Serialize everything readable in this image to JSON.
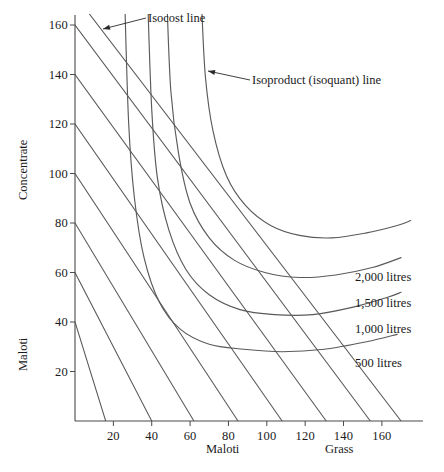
{
  "chart_data": {
    "type": "line",
    "title": "",
    "xlabel_left": "Maloti",
    "xlabel_right": "Grass",
    "ylabel_top": "Concentrate",
    "ylabel_bottom": "Maloti",
    "xlim": [
      0,
      170
    ],
    "ylim": [
      0,
      168
    ],
    "grid": false,
    "legend_position": "inline-right",
    "x_ticks": [
      20,
      40,
      60,
      80,
      100,
      120,
      140,
      160
    ],
    "y_ticks": [
      20,
      40,
      60,
      80,
      100,
      120,
      140,
      160
    ],
    "x_tick_labels": [
      "20",
      "40",
      "60",
      "80",
      "100",
      "120",
      "140",
      "160"
    ],
    "y_tick_labels": [
      "20",
      "40",
      "60",
      "80",
      "100",
      "120",
      "140",
      "160"
    ],
    "annotations": [
      {
        "name": "isocost-annotation",
        "text": "Isocost line",
        "label_x": 148,
        "label_y": 11,
        "arrow_from_x": 146,
        "arrow_from_y": 18,
        "arrow_to_x": 103,
        "arrow_to_y": 29
      },
      {
        "name": "isoquant-annotation",
        "text": "Isoproduct (isoquant) line",
        "label_x": 252,
        "label_y": 73,
        "arrow_from_x": 250,
        "arrow_from_y": 80,
        "arrow_to_x": 208,
        "arrow_to_y": 71
      }
    ],
    "series": [
      {
        "name": "isocost-1",
        "kind": "isocost",
        "points": [
          [
            0,
            40
          ],
          [
            16,
            0
          ]
        ]
      },
      {
        "name": "isocost-2",
        "kind": "isocost",
        "points": [
          [
            0,
            60
          ],
          [
            40,
            0
          ]
        ]
      },
      {
        "name": "isocost-3",
        "kind": "isocost",
        "points": [
          [
            0,
            80
          ],
          [
            62,
            0
          ]
        ]
      },
      {
        "name": "isocost-4",
        "kind": "isocost",
        "points": [
          [
            0,
            100
          ],
          [
            85,
            0
          ]
        ]
      },
      {
        "name": "isocost-5",
        "kind": "isocost",
        "points": [
          [
            0,
            120
          ],
          [
            108,
            0
          ]
        ]
      },
      {
        "name": "isocost-6",
        "kind": "isocost",
        "points": [
          [
            0,
            140
          ],
          [
            131,
            0
          ]
        ]
      },
      {
        "name": "isocost-7",
        "kind": "isocost",
        "points": [
          [
            0,
            160
          ],
          [
            154,
            0
          ]
        ]
      },
      {
        "name": "isocost-8",
        "kind": "isocost",
        "points": [
          [
            4,
            168
          ],
          [
            170,
            0
          ]
        ]
      },
      {
        "name": "500 litres",
        "kind": "isoquant",
        "value": 500,
        "label": "500 litres",
        "label_x": 355,
        "label_y": 363,
        "points": [
          [
            26,
            168
          ],
          [
            28,
            120
          ],
          [
            31,
            90
          ],
          [
            36,
            66
          ],
          [
            44,
            48
          ],
          [
            55,
            37
          ],
          [
            70,
            31
          ],
          [
            88,
            29
          ],
          [
            108,
            28
          ],
          [
            130,
            29
          ],
          [
            152,
            32
          ],
          [
            168,
            35
          ]
        ]
      },
      {
        "name": "1,000 litres",
        "kind": "isoquant",
        "value": 1000,
        "label": "1,000 litres",
        "label_x": 355,
        "label_y": 329,
        "points": [
          [
            38,
            168
          ],
          [
            40,
            126
          ],
          [
            43,
            98
          ],
          [
            49,
            77
          ],
          [
            58,
            61
          ],
          [
            70,
            51
          ],
          [
            86,
            45
          ],
          [
            104,
            43
          ],
          [
            124,
            43
          ],
          [
            145,
            46
          ],
          [
            163,
            50
          ],
          [
            170,
            52
          ]
        ]
      },
      {
        "name": "1,500 litres",
        "kind": "isoquant",
        "value": 1500,
        "label": "1,500 litres",
        "label_x": 355,
        "label_y": 303,
        "points": [
          [
            48,
            168
          ],
          [
            50,
            133
          ],
          [
            54,
            108
          ],
          [
            60,
            88
          ],
          [
            70,
            74
          ],
          [
            83,
            65
          ],
          [
            99,
            60
          ],
          [
            117,
            58
          ],
          [
            136,
            59
          ],
          [
            155,
            62
          ],
          [
            170,
            66
          ]
        ]
      },
      {
        "name": "2,000 litres",
        "kind": "isoquant",
        "value": 2000,
        "label": "2,000 litres",
        "label_x": 355,
        "label_y": 277,
        "points": [
          [
            66,
            168
          ],
          [
            68,
            139
          ],
          [
            72,
            117
          ],
          [
            79,
            99
          ],
          [
            89,
            87
          ],
          [
            102,
            79
          ],
          [
            117,
            75
          ],
          [
            134,
            74
          ],
          [
            152,
            76
          ],
          [
            168,
            79
          ],
          [
            175,
            81
          ]
        ]
      }
    ]
  }
}
